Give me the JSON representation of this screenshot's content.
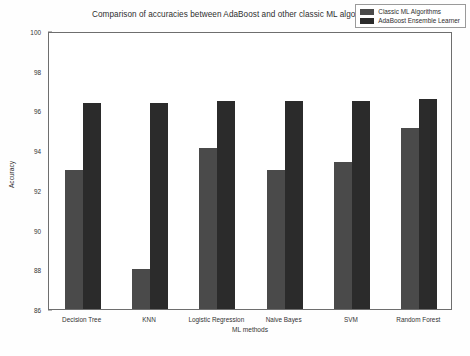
{
  "chart_data": {
    "type": "bar",
    "title": "Comparison of accuracies between AdaBoost and other classic ML algorithms",
    "xlabel": "ML methods",
    "ylabel": "Accuracy",
    "categories": [
      "Decision Tree",
      "KNN",
      "Logistic Regression",
      "Naive Bayes",
      "SVM",
      "Random Forest"
    ],
    "series": [
      {
        "name": "Classic ML Algorithms",
        "color": "#4a4a4a",
        "values": [
          93.0,
          88.0,
          94.1,
          93.0,
          93.4,
          95.1
        ]
      },
      {
        "name": "AdaBoost Ensemble Learner",
        "color": "#2b2b2b",
        "values": [
          96.4,
          96.4,
          96.5,
          96.5,
          96.5,
          96.6
        ]
      }
    ],
    "ylim": [
      86,
      100
    ],
    "yticks": [
      86,
      88,
      90,
      92,
      94,
      96,
      98,
      100
    ],
    "grid": false,
    "legend_position": "top-right"
  }
}
